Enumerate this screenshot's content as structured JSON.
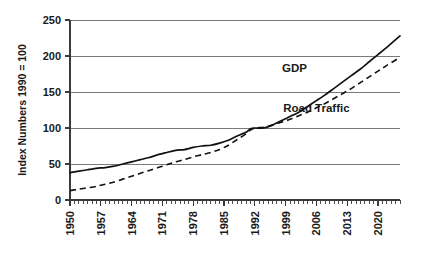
{
  "chart_data": {
    "type": "line",
    "title": "",
    "subtitle": "",
    "xlabel": "",
    "ylabel": "Index Numbers 1990 = 100",
    "ylim": [
      0,
      250
    ],
    "xlim": [
      1950,
      2025
    ],
    "grid": true,
    "grid_axis": "y",
    "legend_position": "inline-annotations",
    "ytick_labels": [
      "0",
      "50",
      "100",
      "150",
      "200",
      "250"
    ],
    "ytick_values": [
      0,
      50,
      100,
      150,
      200,
      250
    ],
    "xtick_labels": [
      "1950",
      "1957",
      "1964",
      "1971",
      "1978",
      "1985",
      "1992",
      "1999",
      "2006",
      "2013",
      "2020"
    ],
    "xtick_values": [
      1950,
      1957,
      1964,
      1971,
      1978,
      1985,
      1992,
      1999,
      2006,
      2013,
      2020
    ],
    "x_minor_tick_interval": 1,
    "annotations": [
      {
        "text": "GDP",
        "x": 2001,
        "y": 178
      },
      {
        "text": "Road Traffic",
        "x": 2006,
        "y": 122
      }
    ],
    "series": [
      {
        "name": "GDP",
        "style": "solid",
        "color": "#111111",
        "x": [
          1950,
          1952,
          1954,
          1956,
          1958,
          1960,
          1962,
          1964,
          1966,
          1968,
          1970,
          1972,
          1974,
          1976,
          1978,
          1980,
          1982,
          1984,
          1986,
          1988,
          1990,
          1991,
          1992,
          1994,
          1996,
          1998,
          2000,
          2002,
          2004,
          2006,
          2008,
          2010,
          2012,
          2014,
          2016,
          2018,
          2020,
          2022,
          2025
        ],
        "values": [
          38,
          40,
          42,
          44,
          45,
          47,
          50,
          53,
          56,
          59,
          63,
          66,
          69,
          70,
          73,
          75,
          76,
          79,
          83,
          89,
          94,
          99,
          100,
          100,
          104,
          110,
          116,
          122,
          130,
          138,
          146,
          155,
          164,
          173,
          182,
          192,
          202,
          212,
          228
        ]
      },
      {
        "name": "Road Traffic",
        "style": "dashed",
        "color": "#111111",
        "x": [
          1950,
          1952,
          1954,
          1956,
          1958,
          1960,
          1962,
          1964,
          1966,
          1968,
          1970,
          1972,
          1974,
          1976,
          1978,
          1980,
          1982,
          1984,
          1986,
          1988,
          1990,
          1991,
          1992,
          1994,
          1996,
          1998,
          2000,
          2002,
          2004,
          2006,
          2008,
          2010,
          2012,
          2014,
          2016,
          2018,
          2020,
          2022,
          2025
        ],
        "values": [
          13,
          15,
          17,
          19,
          22,
          25,
          29,
          33,
          37,
          41,
          45,
          49,
          53,
          56,
          60,
          63,
          66,
          70,
          76,
          84,
          92,
          97,
          100,
          101,
          104,
          108,
          112,
          117,
          122,
          128,
          134,
          141,
          148,
          155,
          163,
          171,
          179,
          187,
          198
        ]
      }
    ]
  }
}
